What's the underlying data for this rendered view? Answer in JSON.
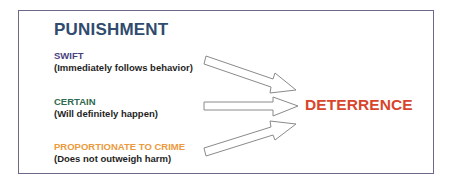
{
  "title": "PUNISHMENT",
  "items": [
    {
      "heading": "SWIFT",
      "description": "(Immediately follows behavior)",
      "color": "#4a3f7e"
    },
    {
      "heading": "CERTAIN",
      "description": "(Will definitely happen)",
      "color": "#2f6a4e"
    },
    {
      "heading": "PROPORTIONATE TO CRIME",
      "description": "(Does not outweigh harm)",
      "color": "#ec9a3c"
    }
  ],
  "result": {
    "label": "DETERRENCE",
    "color": "#d8452b"
  },
  "colors": {
    "title": "#2f4b6e",
    "frame_border": "#6a6a86",
    "arrow_stroke": "#8a8a8a",
    "description_text": "#1f1f24"
  }
}
